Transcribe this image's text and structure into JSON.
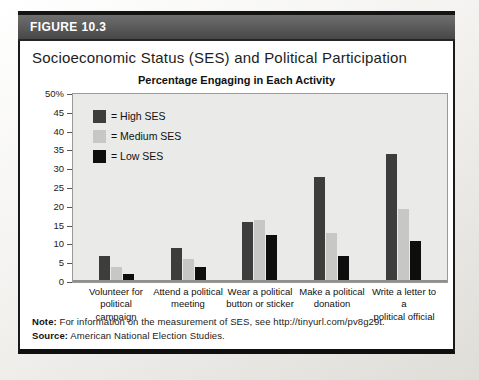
{
  "figure": {
    "label": "FIGURE 10.3"
  },
  "title": "Socioeconomic Status (SES) and Political Participation",
  "chart_data": {
    "type": "bar",
    "title": "Percentage Engaging in Each Activity",
    "categories": [
      [
        "Volunteer for",
        "political campaign"
      ],
      [
        "Attend a political",
        "meeting"
      ],
      [
        "Wear a political",
        "button or sticker"
      ],
      [
        "Make a political",
        "donation"
      ],
      [
        "Write a letter to a",
        "political official"
      ]
    ],
    "series": [
      {
        "name": "High SES",
        "color": "#3d3d3d",
        "values": [
          7,
          9,
          16,
          28,
          34
        ]
      },
      {
        "name": "Medium SES",
        "color": "#c7c7c5",
        "values": [
          4,
          6,
          16.5,
          13,
          19.5
        ]
      },
      {
        "name": "Low SES",
        "color": "#0e0e0e",
        "values": [
          2,
          4,
          12.5,
          7,
          11
        ]
      }
    ],
    "ylim": [
      0,
      50
    ],
    "yticks": [
      0,
      5,
      10,
      15,
      20,
      25,
      30,
      35,
      40,
      45,
      50
    ],
    "ytick_labels": [
      "0",
      "5",
      "10",
      "15",
      "20",
      "25",
      "30",
      "35",
      "40",
      "45",
      "50%"
    ],
    "legend_prefix": "=",
    "legend_position": "top-left",
    "grid": false,
    "plot_background": "#eaeae8"
  },
  "note": {
    "label": "Note:",
    "text": "For information on the measurement of SES, see http://tinyurl.com/pv8g29t."
  },
  "source": {
    "label": "Source:",
    "text": "American National Election Studies."
  }
}
